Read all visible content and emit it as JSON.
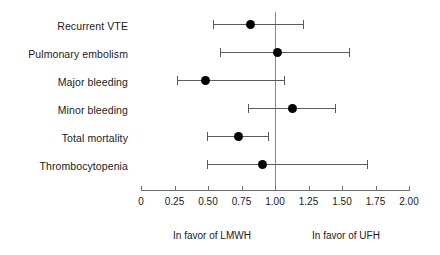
{
  "chart_data": {
    "type": "scatter",
    "subtype": "forest-plot",
    "title": "",
    "xlabel": "",
    "ylabel": "",
    "xlim": [
      0,
      2.0
    ],
    "xticks": [
      0,
      0.25,
      0.5,
      0.75,
      1.0,
      1.25,
      1.5,
      1.75,
      2.0
    ],
    "xtick_labels": [
      "0",
      "0.25",
      "0.50",
      "0.75",
      "1.00",
      "1.25",
      "1.50",
      "1.75",
      "2.00"
    ],
    "grid": false,
    "legend": false,
    "reference_line": 1.0,
    "categories": [
      "Recurrent VTE",
      "Pulmonary embolism",
      "Major bleeding",
      "Minor bleeding",
      "Total mortality",
      "Thrombocytopenia"
    ],
    "values": [
      0.82,
      1.02,
      0.48,
      1.13,
      0.73,
      0.91
    ],
    "ci_low": [
      0.54,
      0.59,
      0.27,
      0.8,
      0.49,
      0.49
    ],
    "ci_high": [
      1.21,
      1.55,
      1.07,
      1.45,
      0.95,
      1.69
    ],
    "points": [
      {
        "label": "Recurrent VTE",
        "estimate": 0.82,
        "ci_low": 0.54,
        "ci_high": 1.21
      },
      {
        "label": "Pulmonary embolism",
        "estimate": 1.02,
        "ci_low": 0.59,
        "ci_high": 1.55
      },
      {
        "label": "Major bleeding",
        "estimate": 0.48,
        "ci_low": 0.27,
        "ci_high": 1.07
      },
      {
        "label": "Minor bleeding",
        "estimate": 1.13,
        "ci_low": 0.8,
        "ci_high": 1.45
      },
      {
        "label": "Total mortality",
        "estimate": 0.73,
        "ci_low": 0.49,
        "ci_high": 0.95
      },
      {
        "label": "Thrombocytopenia",
        "estimate": 0.91,
        "ci_low": 0.49,
        "ci_high": 1.69
      }
    ],
    "annotations": [
      {
        "text": "In favor of LMWH",
        "position": "below-axis-left"
      },
      {
        "text": "In favor of UFH",
        "position": "below-axis-right"
      }
    ],
    "colors": {
      "point": "#000000",
      "ci": "#5b5b5b",
      "axis": "#6e6e6e",
      "reference_line": "#8a8a8a",
      "text": "#1a1a1a",
      "background": "#ffffff"
    }
  },
  "annotations": {
    "favor_left": "In favor of LMWH",
    "favor_right": "In favor of UFH"
  }
}
